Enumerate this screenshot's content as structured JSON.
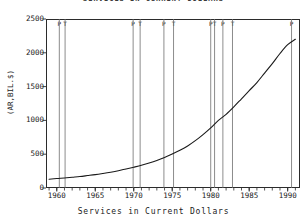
{
  "figure": {
    "title_cut_off": "SERVICES IN CURRENT DOLLARS",
    "background_color": "#ffffff",
    "frame_color": "#2b2b2b",
    "series_color": "#1a1a1a",
    "marker_color": "#6e6e6e"
  },
  "axes": {
    "ylabel": "(AR,BIL.$)",
    "xlabel": "Services in Current Dollars",
    "y_ticks": [
      0,
      500,
      1000,
      1500,
      2000,
      2500
    ],
    "y_tick_labels": [
      "0",
      "500",
      "1000",
      "1500",
      "2000",
      "2500"
    ],
    "x_ticks": [
      1960,
      1965,
      1970,
      1975,
      1980,
      1985,
      1990
    ],
    "x_tick_labels": [
      "1960",
      "1965",
      "1970",
      "1975",
      "1980",
      "1985",
      "1990"
    ],
    "xlim": [
      1958.6,
      1991.6
    ],
    "ylim": [
      0,
      2500
    ]
  },
  "chart_data": {
    "type": "line",
    "title": "SERVICES IN CURRENT DOLLARS",
    "xlabel": "Services in Current Dollars",
    "ylabel": "(AR,BIL.$)",
    "xlim": [
      1958.6,
      1991.6
    ],
    "ylim": [
      0,
      2500
    ],
    "grid": false,
    "legend": "none",
    "x": [
      1959,
      1960,
      1961,
      1962,
      1963,
      1964,
      1965,
      1966,
      1967,
      1968,
      1969,
      1970,
      1971,
      1972,
      1973,
      1974,
      1975,
      1976,
      1977,
      1978,
      1979,
      1980,
      1981,
      1982,
      1983,
      1984,
      1985,
      1986,
      1987,
      1988,
      1989,
      1990,
      1991
    ],
    "series": [
      {
        "name": "Services in Current Dollars",
        "values": [
          130,
          140,
          148,
          159,
          170,
          184,
          198,
          215,
          234,
          256,
          282,
          308,
          336,
          370,
          408,
          452,
          502,
          558,
          622,
          700,
          790,
          890,
          1000,
          1090,
          1200,
          1320,
          1440,
          1560,
          1700,
          1840,
          1990,
          2120,
          2200
        ]
      }
    ],
    "vertical_markers": [
      {
        "x": 1960.33,
        "label": "P",
        "type": "peak"
      },
      {
        "x": 1961.08,
        "label": "T",
        "type": "trough"
      },
      {
        "x": 1969.92,
        "label": "P",
        "type": "peak"
      },
      {
        "x": 1970.83,
        "label": "T",
        "type": "trough"
      },
      {
        "x": 1973.92,
        "label": "P",
        "type": "peak"
      },
      {
        "x": 1975.17,
        "label": "T",
        "type": "trough"
      },
      {
        "x": 1980.0,
        "label": "P",
        "type": "peak"
      },
      {
        "x": 1980.5,
        "label": "T",
        "type": "trough"
      },
      {
        "x": 1981.58,
        "label": "P",
        "type": "peak"
      },
      {
        "x": 1982.83,
        "label": "T",
        "type": "trough"
      },
      {
        "x": 1990.5,
        "label": "P",
        "type": "peak"
      }
    ]
  }
}
